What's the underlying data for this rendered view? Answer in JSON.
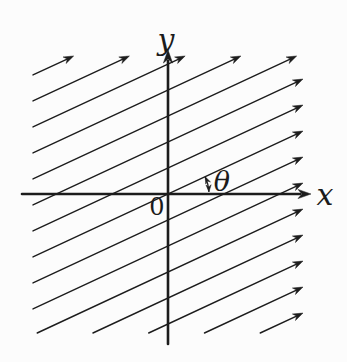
{
  "figure": {
    "type": "vector-field-diagram",
    "labels": {
      "x_axis": "x",
      "y_axis": "y",
      "origin": "0",
      "angle": "θ"
    },
    "colors": {
      "ink": "#1c1c1c",
      "background": "#fcfcfc"
    },
    "geometry": {
      "width": 347,
      "height": 362,
      "origin": {
        "x": 168,
        "y": 194
      },
      "clip": {
        "left": 33,
        "top": 56,
        "right": 303,
        "bottom": 333
      },
      "x_axis": {
        "from": 22,
        "to": 311
      },
      "y_axis": {
        "from": 344,
        "to": 50
      },
      "field_angle_deg": 25,
      "line_spacing_y": 26,
      "line_index_min": -7,
      "line_index_max": 7,
      "field_line_width": 1.4,
      "axis_line_width": 2.6,
      "angle_arc": {
        "radius": 41,
        "start_deg": 25,
        "end_deg": 3
      },
      "label_positions": {
        "x_axis": {
          "x": 325,
          "y": 195
        },
        "y_axis": {
          "x": 166,
          "y": 40
        },
        "origin": {
          "x": 157,
          "y": 207
        },
        "angle": {
          "x": 222,
          "y": 181
        }
      }
    }
  }
}
